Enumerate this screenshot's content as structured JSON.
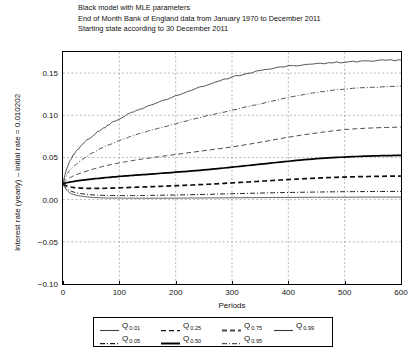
{
  "titles": [
    "Black model with MLE parameters",
    "End of Month Bank of England data from January 1970 to December 2011",
    "Starting state according to 30 December 2011"
  ],
  "axes": {
    "xlabel": "Periods",
    "ylabel": "Interest rate (yearly) – initial rate = 0.010202",
    "xticks": [
      "0",
      "100",
      "200",
      "300",
      "400",
      "500",
      "600"
    ],
    "yticks": [
      "0.15",
      "0.10",
      "0.05",
      "0.00",
      "−0.05",
      "−0.10"
    ]
  },
  "legend": {
    "entries": [
      {
        "label": "Q",
        "sub": "0.01",
        "style": "solid-thin",
        "name": "legend-q001"
      },
      {
        "label": "Q",
        "sub": "0.05",
        "style": "dashdot-thin",
        "name": "legend-q005"
      },
      {
        "label": "Q",
        "sub": "0.25",
        "style": "dashed-thin",
        "name": "legend-q025"
      },
      {
        "label": "Q",
        "sub": "0.50",
        "style": "solid-thick",
        "name": "legend-q050"
      },
      {
        "label": "Q",
        "sub": "0.75",
        "style": "dashed-thick",
        "name": "legend-q075"
      },
      {
        "label": "Q",
        "sub": "0.95",
        "style": "dashdot-thin",
        "name": "legend-q095"
      },
      {
        "label": "Q",
        "sub": "0.99",
        "style": "solid-thin",
        "name": "legend-q099"
      }
    ]
  },
  "chart_data": {
    "type": "line",
    "title": "Black model with MLE parameters",
    "subtitle": "End of Month Bank of England data from January 1970 to December 2011; Starting state according to 30 December 2011",
    "xlabel": "Periods",
    "ylabel": "Interest rate (yearly) – initial rate = 0.010202",
    "xlim": [
      0,
      600
    ],
    "ylim": [
      -0.1,
      0.175
    ],
    "xticks": [
      0,
      100,
      200,
      300,
      400,
      500,
      600
    ],
    "yticks": [
      -0.1,
      -0.05,
      0.0,
      0.05,
      0.1,
      0.15
    ],
    "grid": true,
    "legend_position": "below-axes",
    "x": [
      0,
      10,
      25,
      50,
      75,
      100,
      125,
      150,
      200,
      250,
      300,
      350,
      400,
      450,
      500,
      550,
      600
    ],
    "series": [
      {
        "name": "Q_0.99",
        "style": "solid-thin",
        "color": "#3a3a3a",
        "values": [
          0.0205,
          0.043,
          0.0585,
          0.0745,
          0.086,
          0.096,
          0.104,
          0.1105,
          0.123,
          0.1345,
          0.145,
          0.153,
          0.158,
          0.161,
          0.163,
          0.1645,
          0.1655
        ]
      },
      {
        "name": "Q_0.95",
        "style": "dashdot-thin",
        "color": "#555555",
        "values": [
          0.02,
          0.033,
          0.043,
          0.0545,
          0.063,
          0.07,
          0.076,
          0.081,
          0.09,
          0.0985,
          0.106,
          0.1135,
          0.121,
          0.127,
          0.131,
          0.133,
          0.1345
        ]
      },
      {
        "name": "Q_0.75",
        "style": "dashed-thin",
        "color": "#4a4a4a",
        "values": [
          0.0195,
          0.025,
          0.03,
          0.0355,
          0.04,
          0.0435,
          0.0465,
          0.049,
          0.0535,
          0.058,
          0.0625,
          0.068,
          0.074,
          0.079,
          0.083,
          0.085,
          0.086
        ]
      },
      {
        "name": "Q_0.50",
        "style": "solid-thick",
        "color": "#000000",
        "values": [
          0.019,
          0.0205,
          0.0222,
          0.0243,
          0.026,
          0.0275,
          0.0288,
          0.03,
          0.0325,
          0.0352,
          0.0385,
          0.042,
          0.0455,
          0.0485,
          0.0505,
          0.0518,
          0.0525
        ]
      },
      {
        "name": "Q_0.25",
        "style": "dashed-thick",
        "color": "#111111",
        "values": [
          0.0185,
          0.0155,
          0.014,
          0.0133,
          0.0135,
          0.014,
          0.0146,
          0.0152,
          0.0165,
          0.018,
          0.0198,
          0.0218,
          0.0238,
          0.0255,
          0.0268,
          0.0275,
          0.028
        ]
      },
      {
        "name": "Q_0.05",
        "style": "dashdot-thin",
        "color": "#222222",
        "values": [
          0.018,
          0.0115,
          0.008,
          0.0058,
          0.005,
          0.0048,
          0.0048,
          0.005,
          0.0055,
          0.0062,
          0.007,
          0.0078,
          0.0085,
          0.009,
          0.0094,
          0.0096,
          0.0098
        ]
      },
      {
        "name": "Q_0.01",
        "style": "solid-thin",
        "color": "#444444",
        "values": [
          0.0178,
          0.009,
          0.005,
          0.0028,
          0.002,
          0.0018,
          0.0017,
          0.0017,
          0.0018,
          0.002,
          0.0022,
          0.0024,
          0.0026,
          0.0028,
          0.0029,
          0.003,
          0.003
        ]
      }
    ]
  }
}
